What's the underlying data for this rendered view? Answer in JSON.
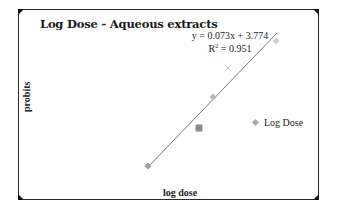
{
  "chart_data": {
    "type": "scatter",
    "title": "Log Dose - Aqueous extracts",
    "xlabel": "log dose",
    "ylabel": "probits",
    "legend": {
      "entries": [
        "Log Dose"
      ],
      "position": "right"
    },
    "grid": false,
    "trendline": {
      "type": "linear",
      "equation": "y = 0.073x + 3.774",
      "r_squared_label": "R",
      "r_squared_value": "= 0.951",
      "slope": 0.073,
      "intercept": 3.774,
      "r_squared": 0.951
    },
    "series": [
      {
        "name": "Log Dose",
        "points_px": [
          {
            "x": 148,
            "y": 166,
            "marker": "diamond",
            "color": "#a0a0a0"
          },
          {
            "x": 199,
            "y": 128,
            "marker": "square",
            "color": "#8c8c8c"
          },
          {
            "x": 213,
            "y": 97,
            "marker": "diamond",
            "color": "#b8b8b8"
          },
          {
            "x": 228,
            "y": 68,
            "marker": "x",
            "color": "#c4c4c4"
          },
          {
            "x": 276,
            "y": 41,
            "marker": "diamond",
            "color": "#d0d0d0"
          }
        ]
      }
    ],
    "trendline_px": {
      "x1": 147,
      "y1": 168,
      "x2": 277,
      "y2": 33
    }
  },
  "colors": {
    "frame": "#2a2a2a",
    "trendline": "#6a6a6a",
    "text": "#1a1a1a"
  }
}
